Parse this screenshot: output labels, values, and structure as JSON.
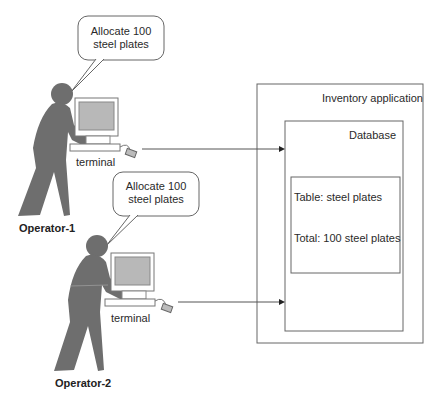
{
  "operators": [
    {
      "name": "Operator-1",
      "speech": [
        "Allocate 100",
        "steel plates"
      ],
      "terminal_label": "terminal"
    },
    {
      "name": "Operator-2",
      "speech": [
        "Allocate 100",
        "steel plates"
      ],
      "terminal_label": "terminal"
    }
  ],
  "application": {
    "title": "Inventory application",
    "database": {
      "title": "Database",
      "table": {
        "name": "Table: steel plates",
        "total": "Total: 100 steel plates"
      }
    }
  },
  "colors": {
    "figure": "#6e6e6e",
    "screen": "#b8b8b8",
    "line": "#555555"
  }
}
